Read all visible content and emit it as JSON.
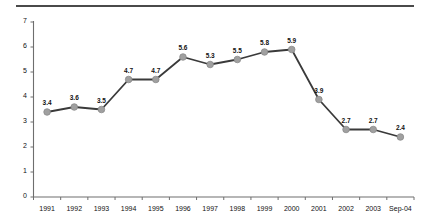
{
  "chart_data": {
    "type": "line",
    "title": "",
    "subtitle": "",
    "xlabel": "",
    "ylabel": "",
    "categories": [
      "1991",
      "1992",
      "1993",
      "1994",
      "1995",
      "1996",
      "1997",
      "1998",
      "1999",
      "2000",
      "2001",
      "2002",
      "2003",
      "Sep-04"
    ],
    "values": [
      3.4,
      3.6,
      3.5,
      4.7,
      4.7,
      5.6,
      5.3,
      5.5,
      5.8,
      5.9,
      3.9,
      2.7,
      2.7,
      2.4
    ],
    "data_labels": [
      "3.4",
      "3.6",
      "3.5",
      "4.7",
      "4.7",
      "5.6",
      "5.3",
      "5.5",
      "5.8",
      "5.9",
      "3.9",
      "2.7",
      "2.7",
      "2.4"
    ],
    "ylim": [
      0,
      7
    ],
    "yticks": [
      0,
      1,
      2,
      3,
      4,
      5,
      6,
      7
    ],
    "ytick_labels": [
      "0",
      "1",
      "2",
      "3",
      "4",
      "5",
      "6",
      "7"
    ],
    "grid": false,
    "legend": "none",
    "series_name": "",
    "colors": {
      "line": "#3a3a3a",
      "marker": "#a0a0a0",
      "marker_edge": "#8a8a8a",
      "axis": "#6e6e6e",
      "text": "#111111",
      "rule": "#4a4a4a",
      "background": "#ffffff"
    }
  }
}
